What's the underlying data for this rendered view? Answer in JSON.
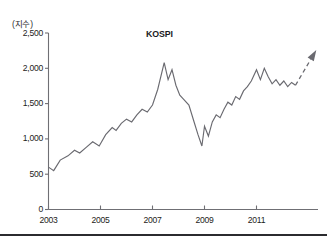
{
  "chart_data": {
    "type": "line",
    "title": "KOSPI",
    "xlabel": "",
    "ylabel": "(지수)",
    "ylabel_note": "index",
    "ylim": [
      0,
      2500
    ],
    "ytick_labels": [
      "0",
      "500",
      "1,000",
      "1,500",
      "2,000",
      "2,500"
    ],
    "ytick_values": [
      0,
      500,
      1000,
      1500,
      2000,
      2500
    ],
    "xlim": [
      2003,
      2013
    ],
    "xtick_labels": [
      "2003",
      "2005",
      "2007",
      "2009",
      "2011"
    ],
    "xtick_values": [
      2003,
      2005,
      2007,
      2009,
      2011
    ],
    "grid": false,
    "legend": false,
    "series": [
      {
        "name": "KOSPI",
        "style": "solid",
        "x": [
          2003.0,
          2003.2,
          2003.45,
          2003.75,
          2004.0,
          2004.2,
          2004.45,
          2004.7,
          2004.95,
          2005.2,
          2005.45,
          2005.6,
          2005.8,
          2006.0,
          2006.2,
          2006.4,
          2006.6,
          2006.8,
          2007.0,
          2007.2,
          2007.45,
          2007.6,
          2007.75,
          2007.9,
          2008.05,
          2008.2,
          2008.4,
          2008.6,
          2008.75,
          2008.9,
          2009.0,
          2009.15,
          2009.3,
          2009.45,
          2009.6,
          2009.75,
          2009.9,
          2010.05,
          2010.2,
          2010.35,
          2010.5,
          2010.65,
          2010.8,
          2011.0,
          2011.15,
          2011.3,
          2011.45,
          2011.6,
          2011.75,
          2011.9,
          2012.05,
          2012.2,
          2012.35,
          2012.5
        ],
        "y": [
          600,
          550,
          700,
          760,
          840,
          800,
          880,
          960,
          900,
          1060,
          1160,
          1120,
          1220,
          1280,
          1240,
          1340,
          1420,
          1380,
          1480,
          1700,
          2080,
          1840,
          1980,
          1760,
          1620,
          1560,
          1480,
          1240,
          1060,
          900,
          1180,
          1040,
          1240,
          1340,
          1300,
          1420,
          1520,
          1480,
          1600,
          1560,
          1680,
          1740,
          1820,
          1980,
          1840,
          2000,
          1880,
          1780,
          1840,
          1760,
          1820,
          1740,
          1800,
          1760
        ]
      },
      {
        "name": "projection",
        "style": "dashed-arrow",
        "x": [
          2012.5,
          2013.3
        ],
        "y": [
          1760,
          2260
        ]
      }
    ],
    "annotations": [
      {
        "name": "forecast-arrow",
        "text": "",
        "kind": "dashed upward arrow indicating projected rise"
      }
    ]
  }
}
